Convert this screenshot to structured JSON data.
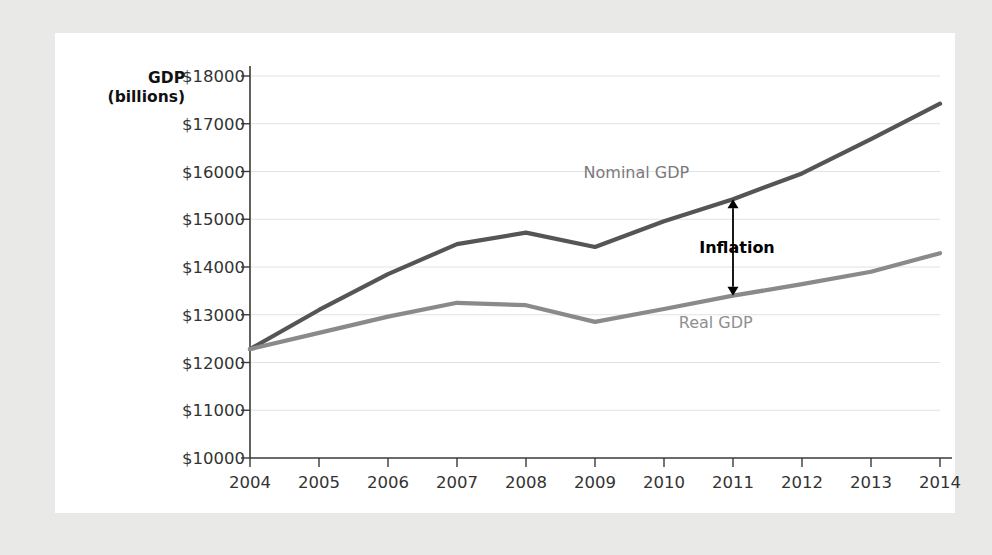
{
  "chart_data": {
    "type": "line",
    "title": "",
    "xlabel": "",
    "ylabel": "GDP (billions)",
    "ylabel_line1": "GDP",
    "ylabel_line2": "(billions)",
    "x": [
      2004,
      2005,
      2006,
      2007,
      2008,
      2009,
      2010,
      2011,
      2012,
      2013,
      2014
    ],
    "categories": [
      "2004",
      "2005",
      "2006",
      "2007",
      "2008",
      "2009",
      "2010",
      "2011",
      "2012",
      "2013",
      "2014"
    ],
    "xlim": [
      2004,
      2014
    ],
    "ylim": [
      10000,
      18000
    ],
    "ytick_values": [
      10000,
      11000,
      12000,
      13000,
      14000,
      15000,
      16000,
      17000,
      18000
    ],
    "ytick_labels": [
      "$10000",
      "$11000",
      "$12000",
      "$13000",
      "$14000",
      "$15000",
      "$16000",
      "$17000",
      "$18000"
    ],
    "grid": true,
    "legend_position": "inline-labels",
    "series": [
      {
        "name": "Nominal GDP",
        "color": "#555555",
        "values": [
          12280,
          13100,
          13850,
          14480,
          14720,
          14420,
          14960,
          15420,
          15960,
          16680,
          17420
        ]
      },
      {
        "name": "Real GDP",
        "color": "#8a8a8a",
        "values": [
          12280,
          12620,
          12960,
          13250,
          13200,
          12850,
          13120,
          13400,
          13640,
          13900,
          14290
        ]
      }
    ],
    "annotations": [
      {
        "text": "Inflation",
        "type": "double-arrow",
        "at_x": 2011,
        "from_value": 15420,
        "to_value": 13400,
        "color": "#000000"
      }
    ],
    "series_inline_labels": [
      {
        "text": "Nominal GDP",
        "at_x": 2009.6,
        "at_value": 15980,
        "color": "#7a7a7a"
      },
      {
        "text": "Real GDP",
        "at_x": 2010.75,
        "at_value": 12840,
        "color": "#8f8f8f"
      }
    ]
  },
  "style": {
    "page_background": "#e9e9e7",
    "card_background": "#ffffff",
    "grid_color": "#e2e2e2",
    "axis_color": "#3a3a3a",
    "tick_text_color": "#333333"
  }
}
